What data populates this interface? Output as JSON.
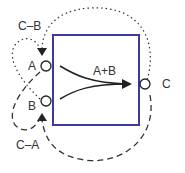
{
  "diagram": {
    "box_color": "#3a3aa0",
    "ports": {
      "a": "A",
      "b": "B",
      "c": "C"
    },
    "labels": {
      "sum": "A+B",
      "c_minus_b": "C–B",
      "c_minus_a": "C–A"
    }
  }
}
